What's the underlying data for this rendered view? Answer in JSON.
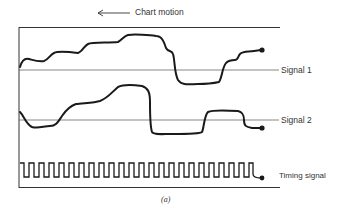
{
  "header": {
    "motion_label": "Chart motion",
    "motion_arrow": "left-arrow"
  },
  "traces": [
    {
      "name": "signal-1",
      "label": "Signal 1"
    },
    {
      "name": "signal-2",
      "label": "Signal 2"
    },
    {
      "name": "timing-signal",
      "label": "Timing signal",
      "pulse_count": 22
    }
  ],
  "caption": "(a)",
  "colors": {
    "ink": "#1a1a1a",
    "baseline": "#555555",
    "background": "#ffffff"
  }
}
